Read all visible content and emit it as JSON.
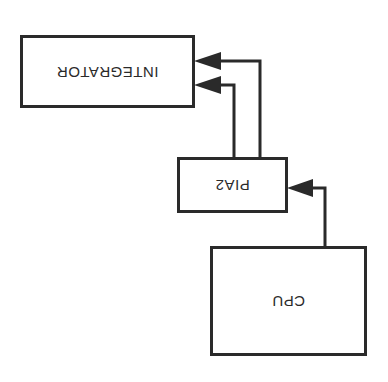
{
  "diagram": {
    "orientation": "rotated-180",
    "line_color": "#2a2a2a",
    "background": "#ffffff",
    "nodes": [
      {
        "id": "integrator",
        "label": "INTEGRATOR"
      },
      {
        "id": "pia2",
        "label": "PIA2"
      },
      {
        "id": "cpu",
        "label": "CPU"
      }
    ],
    "edges": [
      {
        "from": "cpu",
        "to": "pia2"
      },
      {
        "from": "pia2",
        "to": "integrator"
      },
      {
        "from": "pia2",
        "to": "integrator"
      }
    ]
  }
}
